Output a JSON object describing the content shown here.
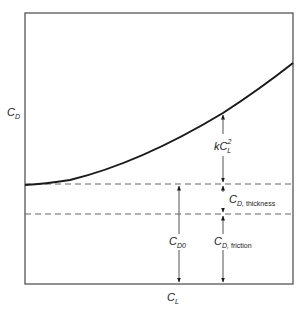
{
  "diagram": {
    "type": "drag-polar",
    "axes": {
      "x_label": {
        "main": "C",
        "sub": "L"
      },
      "y_label": {
        "main": "C",
        "sub": "D"
      }
    },
    "frame": {
      "left": 25,
      "top": 13,
      "right": 293,
      "bottom": 284
    },
    "curve": {
      "name": "drag curve C_D vs C_L",
      "start": [
        25,
        185
      ],
      "end": [
        293,
        63
      ]
    },
    "reference_lines": [
      {
        "name": "C_D0 level",
        "y": 184,
        "style": "dashed"
      },
      {
        "name": "friction level",
        "y": 214,
        "style": "dashed"
      }
    ],
    "annotations": {
      "induced": {
        "main": "kC",
        "sup": "2",
        "sub": "L"
      },
      "thickness": {
        "main": "C",
        "sub": "D,",
        "word": "thickness"
      },
      "zero_lift": {
        "main": "C",
        "sub": "D0"
      },
      "friction": {
        "main": "C",
        "sub": "D,",
        "word": "friction"
      }
    },
    "colors": {
      "line": "#1a1a1a",
      "frame": "#555555",
      "dashed": "#666666",
      "background": "#ffffff"
    }
  }
}
